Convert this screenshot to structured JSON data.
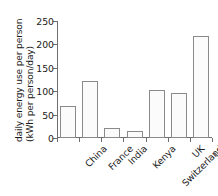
{
  "chart_data": {
    "type": "bar",
    "title": "",
    "xlabel": "",
    "ylabel": "daily energy use per person (kWh per person/day)",
    "ylabel_line1": "daily energy use per person",
    "ylabel_line2": "(kWh per person/day)",
    "categories": [
      "China",
      "France",
      "India",
      "Kenya",
      "Switzerland",
      "UK",
      "US"
    ],
    "values": [
      68,
      122,
      21,
      15,
      102,
      96,
      217
    ],
    "ylim": [
      0,
      250
    ],
    "yticks": [
      0,
      50,
      100,
      150,
      200,
      250
    ],
    "ytick_labels": [
      "0",
      "50",
      "100",
      "150",
      "200",
      "250"
    ],
    "grid": false,
    "legend": null,
    "bar_fill_color": "#fbfbfb",
    "bar_edge_color": "#8a8a8a",
    "axis_color": "#6e6e6e",
    "text_color": "#1a1a1a"
  }
}
